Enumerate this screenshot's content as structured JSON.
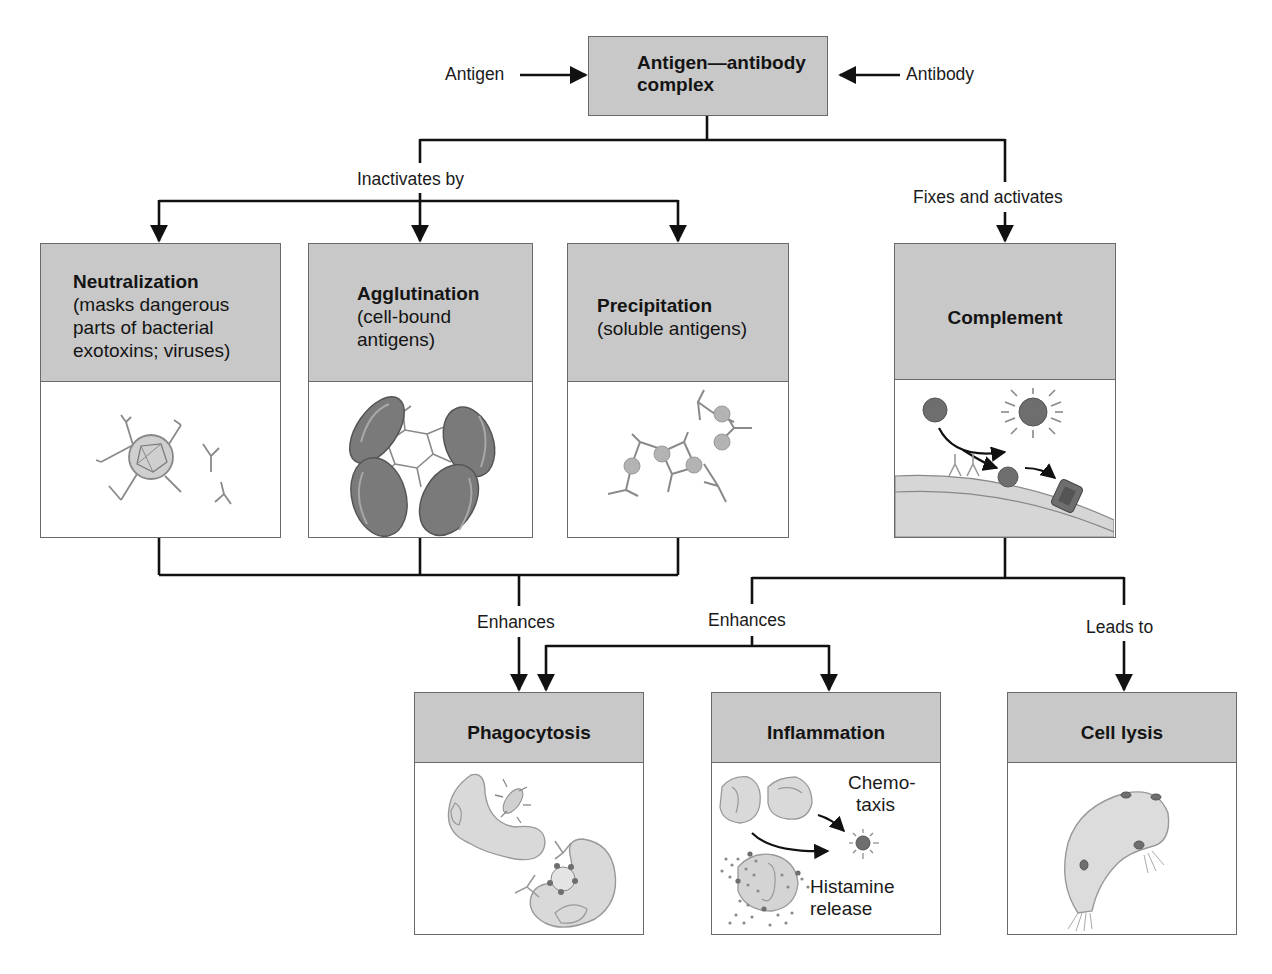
{
  "top": {
    "input_left": "Antigen",
    "input_right": "Antibody",
    "center_box": {
      "line1": "Antigen—antibody",
      "line2": "complex"
    }
  },
  "branches": {
    "left_label": "Inactivates by",
    "right_label": "Fixes and activates"
  },
  "mechanisms": [
    {
      "title": "Neutralization",
      "desc": [
        "(masks dangerous",
        "parts of bacterial",
        "exotoxins; viruses)"
      ]
    },
    {
      "title": "Agglutination",
      "desc": [
        "(cell-bound",
        "antigens)"
      ]
    },
    {
      "title": "Precipitation",
      "desc": [
        "(soluble antigens)"
      ]
    },
    {
      "title": "Complement",
      "desc": []
    }
  ],
  "outcome_labels": {
    "enhances_1": "Enhances",
    "enhances_2": "Enhances",
    "leads_to": "Leads to"
  },
  "outcomes": [
    {
      "title": "Phagocytosis"
    },
    {
      "title": "Inflammation",
      "annotations": {
        "chemotaxis_1": "Chemo-",
        "chemotaxis_2": "taxis",
        "histamine_1": "Histamine",
        "histamine_2": "release"
      }
    },
    {
      "title": "Cell lysis"
    }
  ],
  "colors": {
    "header_fill": "#c8c8c8",
    "border": "#6a6a6a",
    "line": "#111111",
    "cell_fill": "#d9d9d9",
    "cell_dark": "#6e6e6e"
  }
}
